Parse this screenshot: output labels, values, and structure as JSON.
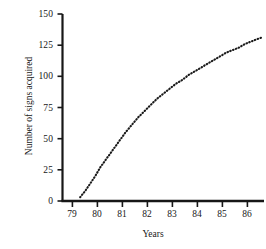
{
  "chart_data": {
    "type": "line",
    "title": "",
    "xlabel": "Years",
    "ylabel": "Number of signs acquired",
    "line_style": "dotted",
    "line_color": "#1a1a1a",
    "grid": false,
    "legend": "none",
    "xlim": [
      78.5,
      86.5
    ],
    "ylim": [
      0,
      150
    ],
    "xticks": [
      "79",
      "80",
      "81",
      "82",
      "83",
      "84",
      "85",
      "86"
    ],
    "xtick_values": [
      79,
      80,
      81,
      82,
      83,
      84,
      85,
      86
    ],
    "yticks": [
      "0",
      "25",
      "50",
      "75",
      "100",
      "125",
      "150"
    ],
    "ytick_values": [
      0,
      25,
      50,
      75,
      100,
      125,
      150
    ],
    "x": [
      79.2,
      79.4,
      79.6,
      79.8,
      80.0,
      80.25,
      80.5,
      80.75,
      81.0,
      81.25,
      81.5,
      81.75,
      82.0,
      82.25,
      82.5,
      82.75,
      83.0,
      83.25,
      83.5,
      83.75,
      84.0,
      84.25,
      84.5,
      84.75,
      85.0,
      85.25,
      85.5,
      85.75,
      86.0,
      86.25,
      86.4
    ],
    "values": [
      3,
      8,
      14,
      20,
      27,
      34,
      41,
      48,
      55,
      61,
      67,
      72,
      77,
      82,
      86,
      90,
      94,
      97,
      101,
      104,
      107,
      110,
      113,
      116,
      119,
      121,
      123,
      126,
      128,
      130,
      131
    ],
    "series": [
      {
        "name": "Signs acquired",
        "values": [
          3,
          8,
          14,
          20,
          27,
          34,
          41,
          48,
          55,
          61,
          67,
          72,
          77,
          82,
          86,
          90,
          94,
          97,
          101,
          104,
          107,
          110,
          113,
          116,
          119,
          121,
          123,
          126,
          128,
          130,
          131
        ]
      }
    ]
  }
}
